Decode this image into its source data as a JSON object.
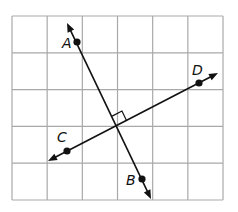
{
  "diagram": {
    "title": "",
    "grid": {
      "columns": 6,
      "rows": 5,
      "origin_px": [
        12,
        16
      ],
      "cell_width_px": 35.17,
      "cell_height_px": 36.8,
      "line_color": "#a9a9a9"
    },
    "points": [
      {
        "id": "A",
        "label": "A",
        "x": 77,
        "y": 42,
        "label_x": 62,
        "label_y": 48
      },
      {
        "id": "B",
        "label": "B",
        "x": 142,
        "y": 179,
        "label_x": 126,
        "label_y": 185
      },
      {
        "id": "C",
        "label": "C",
        "x": 67,
        "y": 151,
        "label_x": 57,
        "label_y": 142
      },
      {
        "id": "D",
        "label": "D",
        "x": 199,
        "y": 83,
        "label_x": 192,
        "label_y": 75
      }
    ],
    "lines": [
      {
        "id": "AB",
        "through": [
          "A",
          "B"
        ],
        "start": [
          67,
          23
        ],
        "end": [
          151,
          199
        ],
        "arrows": "both"
      },
      {
        "id": "CD",
        "through": [
          "C",
          "D"
        ],
        "start": [
          48,
          161
        ],
        "end": [
          218,
          73
        ],
        "arrows": "both"
      }
    ],
    "intersection": {
      "x": 117,
      "y": 126
    },
    "right_angle_marker": true,
    "relationship": "AB ⊥ CD",
    "line_color": "#111111"
  }
}
